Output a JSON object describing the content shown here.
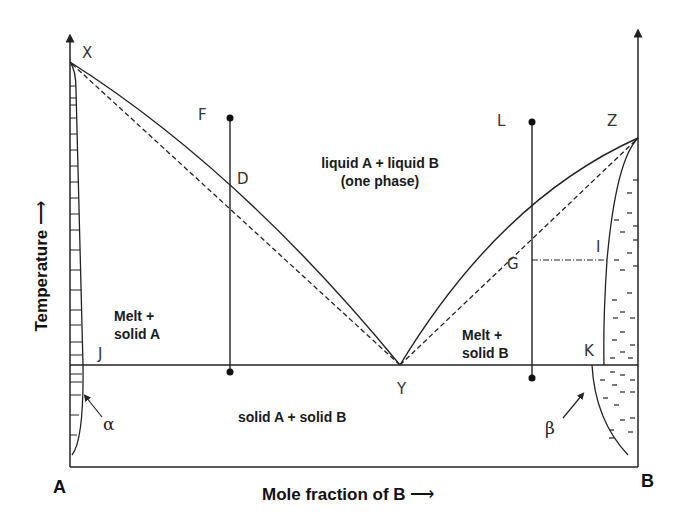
{
  "diagram": {
    "type": "binary eutectic phase diagram",
    "axes": {
      "y_label": "Temperature",
      "x_label": "Mole fraction of B",
      "left_end": "A",
      "right_end": "B"
    },
    "points": {
      "X": "X",
      "Z": "Z",
      "Y": "Y",
      "F": "F",
      "D": "D",
      "L": "L",
      "G": "G",
      "I": "I",
      "J": "J",
      "K": "K"
    },
    "regions": {
      "liquid_line1": "liquid A + liquid B",
      "liquid_line2": "(one phase)",
      "melt_a_line1": "Melt +",
      "melt_a_line2": "solid A",
      "melt_b_line1": "Melt +",
      "melt_b_line2": "solid B",
      "solid": "solid A + solid B"
    },
    "phases": {
      "alpha": "α",
      "beta": "β"
    },
    "colors": {
      "line": "#222222",
      "background": "#ffffff"
    }
  }
}
